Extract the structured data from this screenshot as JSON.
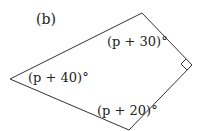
{
  "figure": {
    "label": "(b)",
    "shape": "quadrilateral",
    "angles": [
      {
        "position": "top",
        "text": "(p + 30)°"
      },
      {
        "position": "left",
        "text": "(p + 40)°"
      },
      {
        "position": "bottom",
        "text": "(p + 20)°"
      },
      {
        "position": "right",
        "text": "right angle"
      }
    ],
    "vertices": {
      "top": [
        142,
        13
      ],
      "right": [
        192,
        65
      ],
      "bottom": [
        129,
        130
      ],
      "left": [
        10,
        79
      ]
    },
    "stroke_color": "#333333"
  }
}
